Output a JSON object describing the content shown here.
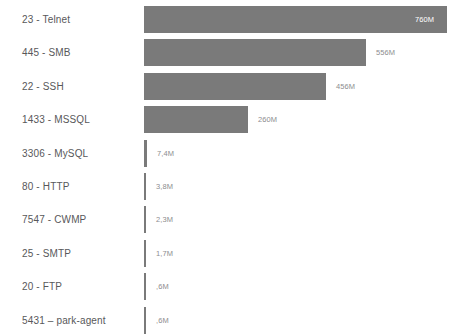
{
  "chart_data": {
    "type": "bar",
    "orientation": "horizontal",
    "title": "",
    "subtitle": "",
    "xlabel": "",
    "ylabel": "",
    "grid": false,
    "legend": null,
    "axis_visible": false,
    "xlim": [
      0,
      760
    ],
    "value_unit": "M",
    "bar_color": "#7a7a7a",
    "label_color": "#58585a",
    "value_color": "#8d8d8f",
    "value_color_inside": "#ffffff",
    "background": "#ffffff",
    "categories": [
      "23 - Telnet",
      "445 - SMB",
      "22 - SSH",
      "1433 - MSSQL",
      "3306 - MySQL",
      "80 - HTTP",
      "7547 - CWMP",
      "25 - SMTP",
      "20 - FTP",
      "5431 – park-agent"
    ],
    "values": [
      760,
      556,
      456,
      260,
      7.4,
      3.8,
      2.3,
      1.7,
      0.6,
      0.6
    ],
    "value_labels": [
      "760M",
      "556M",
      "456M",
      "260M",
      "7,4M",
      "3,8M",
      "2,3M",
      "1,7M",
      ",6M",
      ",6M"
    ],
    "label_inside": [
      true,
      false,
      false,
      false,
      false,
      false,
      false,
      false,
      false,
      false
    ],
    "bars": [
      {
        "category": "23 - Telnet",
        "value": 760,
        "value_label": "760M",
        "bar_px": 303,
        "inside": true
      },
      {
        "category": "445 - SMB",
        "value": 556,
        "value_label": "556M",
        "bar_px": 222,
        "inside": false
      },
      {
        "category": "22 - SSH",
        "value": 456,
        "value_label": "456M",
        "bar_px": 182,
        "inside": false
      },
      {
        "category": "1433 - MSSQL",
        "value": 260,
        "value_label": "260M",
        "bar_px": 104,
        "inside": false
      },
      {
        "category": "3306 - MySQL",
        "value": 7.4,
        "value_label": "7,4M",
        "bar_px": 3,
        "inside": false
      },
      {
        "category": "80 - HTTP",
        "value": 3.8,
        "value_label": "3,8M",
        "bar_px": 2,
        "inside": false
      },
      {
        "category": "7547 - CWMP",
        "value": 2.3,
        "value_label": "2,3M",
        "bar_px": 2,
        "inside": false
      },
      {
        "category": "25 - SMTP",
        "value": 1.7,
        "value_label": "1,7M",
        "bar_px": 2,
        "inside": false
      },
      {
        "category": "20 - FTP",
        "value": 0.6,
        "value_label": ",6M",
        "bar_px": 2,
        "inside": false
      },
      {
        "category": "5431 – park-agent",
        "value": 0.6,
        "value_label": ",6M",
        "bar_px": 2,
        "inside": false
      }
    ]
  },
  "layout": {
    "row_top_start": 6,
    "row_pitch": 33.4,
    "bar_left": 144,
    "bar_height": 27,
    "value_gap": 10,
    "value_inside_right_pad": 8
  }
}
